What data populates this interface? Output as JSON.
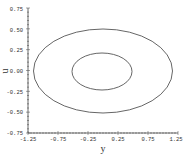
{
  "chart_data": {
    "type": "line",
    "title": "",
    "xlabel": "y",
    "ylabel": "u",
    "xlim": [
      -1.25,
      1.25
    ],
    "ylim": [
      -0.75,
      0.75
    ],
    "grid": false,
    "legend": null,
    "xticks": [
      "-1.25",
      "-0.75",
      "-0.25",
      "0.25",
      "0.75",
      "1.25"
    ],
    "yticks": [
      "0.75",
      "0.50",
      "0.25",
      "0.00",
      "-0.25",
      "-0.50",
      "-0.75"
    ],
    "series": [
      {
        "name": "outer-orbit",
        "shape": "ellipse",
        "center": [
          0.0,
          0.0
        ],
        "rx": 1.16,
        "ry": 0.51,
        "color": "#555555"
      },
      {
        "name": "inner-orbit",
        "shape": "ellipse",
        "center": [
          0.0,
          0.0
        ],
        "rx": 0.5,
        "ry": 0.22,
        "color": "#555555"
      }
    ]
  },
  "labels": {
    "x_axis": "y",
    "y_axis": "u",
    "x_ticks": [
      "-1.25",
      "-0.75",
      "-0.25",
      "0.25",
      "0.75",
      "1.25"
    ],
    "y_ticks": [
      "0.75",
      "0.50",
      "0.25",
      "0.00",
      "-0.25",
      "-0.50",
      "-0.75"
    ]
  }
}
